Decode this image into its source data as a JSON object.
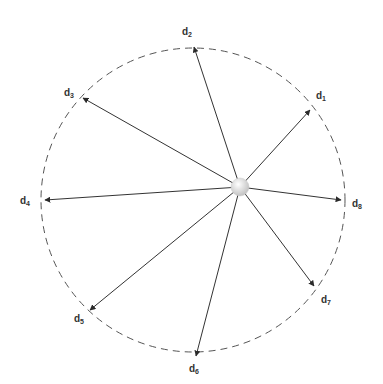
{
  "diagram": {
    "type": "radial-direction-vectors",
    "circle": {
      "cx": 193,
      "cy": 200,
      "r": 152,
      "style": "dashed",
      "color": "#555555"
    },
    "hub": {
      "x": 240,
      "y": 187,
      "r": 9,
      "color": "#d8d8d8"
    },
    "arrow_color": "#333333",
    "vectors": [
      {
        "id": "d1",
        "base": "d",
        "sub": "1",
        "tip": [
          310,
          110
        ],
        "label_pos": [
          316,
          91
        ]
      },
      {
        "id": "d2",
        "base": "d",
        "sub": "2",
        "tip": [
          194,
          47
        ],
        "label_pos": [
          182,
          27
        ]
      },
      {
        "id": "d3",
        "base": "d",
        "sub": "3",
        "tip": [
          83,
          98
        ],
        "label_pos": [
          64,
          88
        ]
      },
      {
        "id": "d4",
        "base": "d",
        "sub": "4",
        "tip": [
          45,
          200
        ],
        "label_pos": [
          20,
          196
        ]
      },
      {
        "id": "d5",
        "base": "d",
        "sub": "5",
        "tip": [
          90,
          310
        ],
        "label_pos": [
          74,
          314
        ]
      },
      {
        "id": "d6",
        "base": "d",
        "sub": "6",
        "tip": [
          196,
          356
        ],
        "label_pos": [
          189,
          364
        ]
      },
      {
        "id": "d7",
        "base": "d",
        "sub": "7",
        "tip": [
          314,
          286
        ],
        "label_pos": [
          321,
          295
        ]
      },
      {
        "id": "d8",
        "base": "d",
        "sub": "8",
        "tip": [
          341,
          200
        ],
        "label_pos": [
          352,
          199
        ]
      }
    ]
  }
}
